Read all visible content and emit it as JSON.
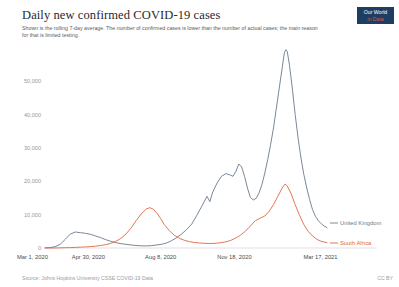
{
  "header": {
    "title": "Daily new confirmed COVID-19 cases",
    "subtitle": "Shown is the rolling 7-day average. The number of confirmed cases is lower than the number of actual cases; the main reason for that is limited testing.",
    "logo_line1": "Our World",
    "logo_line2": "in Data"
  },
  "footer": {
    "source": "Source: Johns Hopkins University CSSE COVID-19 Data",
    "license": "CC BY"
  },
  "colors": {
    "united_kingdom": "#6a7a8c",
    "south_africa": "#e0683f",
    "axis_text": "#9a9a9a",
    "xaxis_text": "#4a4a4a",
    "baseline": "#cfcfcf",
    "logo_bg": "#1d3d63",
    "logo_accent": "#d9584a"
  },
  "chart_data": {
    "type": "line",
    "title": "Daily new confirmed COVID-19 cases",
    "subtitle": "Shown is the rolling 7-day average. The number of confirmed cases is lower than the number of actual cases; the main reason for that is limited testing.",
    "xlabel": "",
    "ylabel": "",
    "ylim": [
      0,
      60000
    ],
    "ytick_values": [
      0,
      10000,
      20000,
      30000,
      40000,
      50000
    ],
    "ytick_labels": [
      "0",
      "10,000",
      "20,000",
      "30,000",
      "40,000",
      "50,000"
    ],
    "xtick_labels": [
      "Mar 1, 2020",
      "Apr 30, 2020",
      "Aug 8, 2020",
      "Nov 18, 2020",
      "Mar 17, 2021"
    ],
    "xtick_positions": [
      0,
      60,
      160,
      262,
      381
    ],
    "x_range_days": [
      0,
      390
    ],
    "grid": false,
    "legend_position": "right-inline",
    "series": [
      {
        "name": "United Kingdom",
        "color": "#6a7a8c",
        "label_end": "United Kingdom",
        "points": [
          [
            0,
            60
          ],
          [
            7,
            120
          ],
          [
            14,
            400
          ],
          [
            21,
            1100
          ],
          [
            28,
            2600
          ],
          [
            35,
            4200
          ],
          [
            42,
            4800
          ],
          [
            49,
            4600
          ],
          [
            56,
            4400
          ],
          [
            63,
            4100
          ],
          [
            70,
            3600
          ],
          [
            77,
            3100
          ],
          [
            84,
            2500
          ],
          [
            91,
            2000
          ],
          [
            98,
            1600
          ],
          [
            105,
            1300
          ],
          [
            112,
            1100
          ],
          [
            119,
            900
          ],
          [
            126,
            750
          ],
          [
            133,
            650
          ],
          [
            140,
            620
          ],
          [
            147,
            700
          ],
          [
            154,
            900
          ],
          [
            161,
            1100
          ],
          [
            168,
            1500
          ],
          [
            175,
            2200
          ],
          [
            182,
            3100
          ],
          [
            189,
            4200
          ],
          [
            196,
            5600
          ],
          [
            203,
            7200
          ],
          [
            210,
            9800
          ],
          [
            217,
            12600
          ],
          [
            224,
            15500
          ],
          [
            228,
            13900
          ],
          [
            232,
            16800
          ],
          [
            238,
            19500
          ],
          [
            244,
            21500
          ],
          [
            250,
            22300
          ],
          [
            255,
            22000
          ],
          [
            260,
            21500
          ],
          [
            264,
            23000
          ],
          [
            268,
            25200
          ],
          [
            272,
            24300
          ],
          [
            276,
            21500
          ],
          [
            280,
            18000
          ],
          [
            284,
            15200
          ],
          [
            288,
            14400
          ],
          [
            292,
            14900
          ],
          [
            296,
            16500
          ],
          [
            300,
            19000
          ],
          [
            304,
            22500
          ],
          [
            308,
            26500
          ],
          [
            312,
            31000
          ],
          [
            316,
            36000
          ],
          [
            320,
            42000
          ],
          [
            324,
            48000
          ],
          [
            328,
            54000
          ],
          [
            331,
            58500
          ],
          [
            333,
            59500
          ],
          [
            335,
            59000
          ],
          [
            338,
            55000
          ],
          [
            342,
            48000
          ],
          [
            346,
            40000
          ],
          [
            350,
            33000
          ],
          [
            354,
            27000
          ],
          [
            358,
            22000
          ],
          [
            362,
            18000
          ],
          [
            366,
            14500
          ],
          [
            370,
            11500
          ],
          [
            374,
            9500
          ],
          [
            378,
            8200
          ],
          [
            382,
            7300
          ],
          [
            386,
            6600
          ],
          [
            390,
            6100
          ]
        ]
      },
      {
        "name": "South Africa",
        "color": "#e0683f",
        "label_end": "South Africa",
        "points": [
          [
            0,
            0
          ],
          [
            14,
            5
          ],
          [
            21,
            40
          ],
          [
            28,
            90
          ],
          [
            35,
            120
          ],
          [
            42,
            180
          ],
          [
            49,
            250
          ],
          [
            56,
            320
          ],
          [
            63,
            420
          ],
          [
            70,
            560
          ],
          [
            77,
            750
          ],
          [
            84,
            1000
          ],
          [
            91,
            1400
          ],
          [
            98,
            2000
          ],
          [
            105,
            2900
          ],
          [
            112,
            4200
          ],
          [
            119,
            6000
          ],
          [
            126,
            8200
          ],
          [
            133,
            10200
          ],
          [
            140,
            11700
          ],
          [
            145,
            12100
          ],
          [
            150,
            11600
          ],
          [
            155,
            10400
          ],
          [
            160,
            8800
          ],
          [
            165,
            7000
          ],
          [
            172,
            5200
          ],
          [
            179,
            3800
          ],
          [
            186,
            2900
          ],
          [
            193,
            2300
          ],
          [
            200,
            1900
          ],
          [
            207,
            1650
          ],
          [
            214,
            1500
          ],
          [
            221,
            1400
          ],
          [
            228,
            1350
          ],
          [
            235,
            1400
          ],
          [
            242,
            1550
          ],
          [
            249,
            1800
          ],
          [
            256,
            2200
          ],
          [
            263,
            2900
          ],
          [
            270,
            3800
          ],
          [
            277,
            5000
          ],
          [
            284,
            6600
          ],
          [
            291,
            8200
          ],
          [
            298,
            9000
          ],
          [
            304,
            9600
          ],
          [
            310,
            11000
          ],
          [
            316,
            13000
          ],
          [
            322,
            15500
          ],
          [
            328,
            18000
          ],
          [
            332,
            19200
          ],
          [
            335,
            18600
          ],
          [
            340,
            16500
          ],
          [
            346,
            13000
          ],
          [
            352,
            9800
          ],
          [
            358,
            7000
          ],
          [
            364,
            5000
          ],
          [
            370,
            3600
          ],
          [
            376,
            2600
          ],
          [
            382,
            2000
          ],
          [
            390,
            1600
          ]
        ]
      }
    ]
  }
}
